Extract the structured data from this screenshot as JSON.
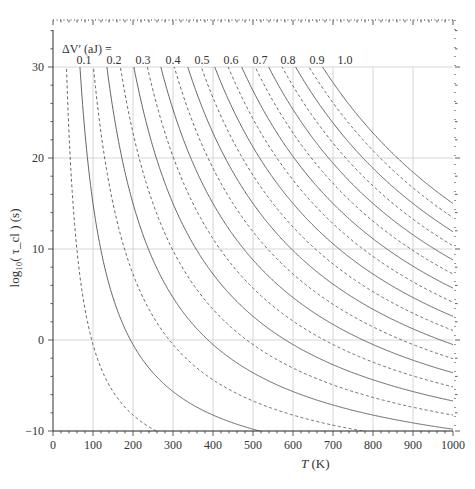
{
  "chart_data": {
    "type": "line",
    "title": "",
    "xlabel": "T (K)",
    "ylabel": "log10(τ_cl) (s)",
    "xlim": [
      0,
      1000
    ],
    "ylim": [
      -10,
      30
    ],
    "x_ticks": [
      0,
      100,
      200,
      300,
      400,
      500,
      600,
      700,
      800,
      900,
      1000
    ],
    "y_ticks": [
      -10,
      0,
      10,
      20,
      30
    ],
    "grid": true,
    "legend": {
      "title": "ΔV′ (aJ) =",
      "position": "top, above curves",
      "entries": [
        "0.1",
        "0.2",
        "0.3",
        "0.4",
        "0.5",
        "0.6",
        "0.7",
        "0.8",
        "0.9",
        "1.0"
      ]
    },
    "model": {
      "form": "log10(tau) = c + B * dV / T",
      "c": -16,
      "B_per_aJ": 31000
    },
    "series": [
      {
        "name": "0.1",
        "style": "solid",
        "dV": 0.1
      },
      {
        "name": "0.2",
        "style": "solid",
        "dV": 0.2
      },
      {
        "name": "0.3",
        "style": "solid",
        "dV": 0.3
      },
      {
        "name": "0.4",
        "style": "solid",
        "dV": 0.4
      },
      {
        "name": "0.5",
        "style": "solid",
        "dV": 0.5
      },
      {
        "name": "0.6",
        "style": "solid",
        "dV": 0.6
      },
      {
        "name": "0.7",
        "style": "solid",
        "dV": 0.7
      },
      {
        "name": "0.8",
        "style": "solid",
        "dV": 0.8
      },
      {
        "name": "0.9",
        "style": "solid",
        "dV": 0.9
      },
      {
        "name": "1.0",
        "style": "solid",
        "dV": 1.0
      },
      {
        "name": "0.05",
        "style": "dashed",
        "dV": 0.05
      },
      {
        "name": "0.15",
        "style": "dashed",
        "dV": 0.15
      },
      {
        "name": "0.25",
        "style": "dashed",
        "dV": 0.25
      },
      {
        "name": "0.35",
        "style": "dashed",
        "dV": 0.35
      },
      {
        "name": "0.45",
        "style": "dashed",
        "dV": 0.45
      },
      {
        "name": "0.55",
        "style": "dashed",
        "dV": 0.55
      },
      {
        "name": "0.65",
        "style": "dashed",
        "dV": 0.65
      },
      {
        "name": "0.75",
        "style": "dashed",
        "dV": 0.75
      },
      {
        "name": "0.85",
        "style": "dashed",
        "dV": 0.85
      },
      {
        "name": "0.95",
        "style": "dashed",
        "dV": 0.95
      }
    ],
    "end_values_at_T1000_solid": {
      "1.0": 15.1,
      "0.9": 11.9,
      "0.8": 8.8,
      "0.7": 5.7,
      "0.6": 2.5,
      "0.5": -0.9,
      "0.4": -4.1,
      "0.3": -7.1,
      "0.2": -9.6
    }
  },
  "labels": {
    "xlabel_italic": "T",
    "xlabel_unit": " (K)",
    "ylabel": "log₁₀( τ_cl ) (s)",
    "legend_title": "ΔV′ (aJ) ="
  },
  "colors": {
    "curve": "#555555",
    "grid": "#cccccc",
    "axis": "#333333"
  }
}
